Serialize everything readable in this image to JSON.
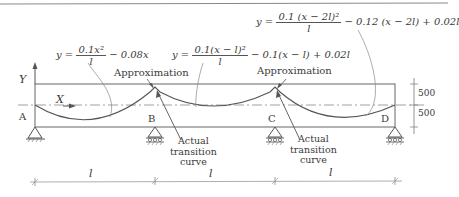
{
  "figure": {
    "equations": {
      "span1": {
        "lhs": "y =",
        "num": "0.1x²",
        "den": "l",
        "rest": "− 0.08x"
      },
      "span2": {
        "lhs": "y =",
        "num": "0.1(x − l)²",
        "den": "l",
        "rest": "− 0.1(x − l) + 0.02l"
      },
      "span3": {
        "lhs": "y =",
        "num": "0.1 (x − 2l)²",
        "den": "l",
        "rest": "− 0.12 (x − 2l) + 0.02l"
      }
    },
    "axes": {
      "y_label": "Y",
      "x_label": "X"
    },
    "annotations": {
      "approx_left": "Approximation",
      "approx_right": "Approximation",
      "actual_left": [
        "Actual",
        "transition",
        "curve"
      ],
      "actual_right": [
        "Actual",
        "transition",
        "curve"
      ]
    },
    "supports": [
      {
        "label": "A",
        "type": "pinned"
      },
      {
        "label": "B",
        "type": "roller"
      },
      {
        "label": "C",
        "type": "roller"
      },
      {
        "label": "D",
        "type": "roller"
      }
    ],
    "dimensions": {
      "spans": [
        "l",
        "l",
        "l"
      ],
      "depth_upper": "500",
      "depth_lower": "500"
    },
    "colors": {
      "line": "#555555",
      "text": "#3a3a3a",
      "background": "#ffffff"
    }
  }
}
